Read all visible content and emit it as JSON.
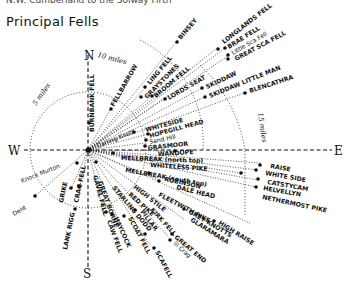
{
  "header": {
    "caption": "N.W. Cumberland to the Solway Firth",
    "title": "Principal Fells"
  },
  "compass": {
    "north": "N",
    "south": "S",
    "east": "E",
    "west": "W"
  },
  "distances": {
    "five": "5 miles",
    "ten": "10 miles",
    "fifteen": "15 miles"
  },
  "fells": {
    "binsey": "BINSEY",
    "longlands": "LONGLANDS FELL",
    "brae": "BRAE FELL",
    "little_sca": "Little Sca Fell",
    "great_sca": "GREAT SCA FELL",
    "ling": "LING FELL",
    "graystones": "GRAYSTONES",
    "broom": "BROOM FELL",
    "lords_seat": "LORDS SEAT",
    "skiddaw": "SKIDDAW",
    "skiddaw_little_man": "SKIDDAW LITTLE MAN",
    "blencathra": "BLENCATHRA",
    "fellbarrow": "FELLBARROW",
    "burnbank": "BURNBANK FELL",
    "carling_knott": "Carling Knott",
    "whiteside": "WHITESIDE",
    "hopegill_head": "HOPEGILL HEAD",
    "sand_hill": "Sand Hill",
    "grasmoor": "GRASMOOR",
    "wandope": "WANDOPE",
    "mellbreak_north": "MELLBREAK (north top)",
    "whiteless_pike": "WHITELESS PIKE",
    "mellbreak_south": "MELLBREAK (south top)",
    "robinson": "ROBINSON",
    "dale_head": "DALE HEAD",
    "fleetwith_pike": "FLEETWITH PIKE",
    "grey_knotts": "GREY KNOTTS",
    "high_raise": "HIGH RAISE",
    "glaramara": "GLARAMARA",
    "great_end": "GREAT END",
    "ill_crag": "Ill Crag",
    "scafell": "SCAFELL",
    "kirk_fell": "KIRK FELL",
    "pillar": "PILLAR",
    "scoat_fell": "SCOAT FELL",
    "haycock": "HAYCOCK",
    "caw_fell": "CAW FELL",
    "high_stile": "HIGH STILE",
    "red_pike": "RED PIKE",
    "starling_dodd": "STARLING DODD",
    "great_borne": "GREAT BORNE",
    "gavel_fell": "GAVEL FELL",
    "crag_fell": "CRAG FELL",
    "grike": "GRIKE",
    "lank_rigg": "LANK RIGG",
    "knock_murton": "Knock Murton",
    "dent": "Dent",
    "raise": "RAISE",
    "white_side": "WHITE SIDE",
    "catstycam": "CATSTYCAM",
    "helvellyn": "HELVELLYN",
    "nethermost_pike": "NETHERMOST PIKE"
  }
}
